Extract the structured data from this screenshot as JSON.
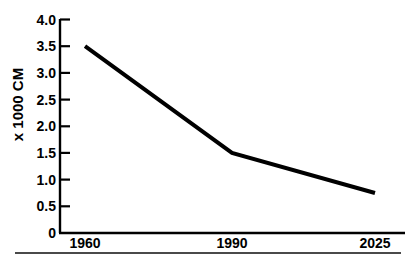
{
  "chart_data": {
    "type": "line",
    "title": "",
    "subtitle": "",
    "xlabel": "",
    "ylabel": "x 1000 CM",
    "categories": [
      "1960",
      "1990",
      "2025"
    ],
    "x": [
      1960,
      1990,
      2025
    ],
    "values": [
      3.5,
      1.5,
      0.75
    ],
    "series": [
      {
        "name": "",
        "values": [
          3.5,
          1.5,
          0.75
        ],
        "color": "#000000",
        "line_width": 4,
        "markers": "none"
      }
    ],
    "ylim": [
      0,
      4.0
    ],
    "yticks": [
      "0",
      "0.5",
      "1.0",
      "1.5",
      "2.0",
      "2.5",
      "3.0",
      "3.5",
      "4.0"
    ],
    "ytick_values": [
      0,
      0.5,
      1.0,
      1.5,
      2.0,
      2.5,
      3.0,
      3.5,
      4.0
    ],
    "xticks": [
      "1960",
      "1990",
      "2025"
    ],
    "grid": false,
    "legend": "none",
    "annotations": [],
    "axis_color": "#000000",
    "background_color": "#ffffff",
    "rule_color": "#4a4a4a"
  }
}
